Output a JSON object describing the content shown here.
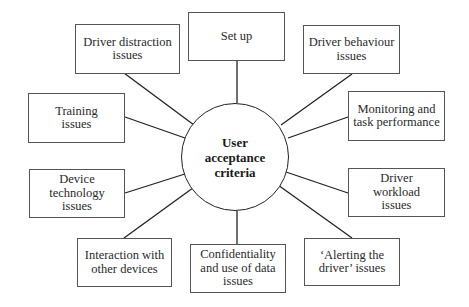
{
  "diagram": {
    "type": "hub-and-spoke",
    "center": {
      "label": "User acceptance criteria",
      "lines": [
        "User",
        "acceptance",
        "criteria"
      ]
    },
    "nodes": [
      {
        "id": "set-up",
        "label": "Set up"
      },
      {
        "id": "driver-behaviour",
        "label": "Driver behaviour issues"
      },
      {
        "id": "monitoring",
        "label": "Monitoring and task performance"
      },
      {
        "id": "driver-workload",
        "label": "Driver workload issues"
      },
      {
        "id": "alerting",
        "label": "‘Alerting the driver’ issues"
      },
      {
        "id": "confidentiality",
        "label": "Confidentiality and use of data issues"
      },
      {
        "id": "interaction",
        "label": "Interaction with other devices"
      },
      {
        "id": "device-technology",
        "label": "Device technology issues"
      },
      {
        "id": "training",
        "label": "Training issues"
      },
      {
        "id": "driver-distraction",
        "label": "Driver distraction issues"
      }
    ],
    "colors": {
      "line": "#222222",
      "box_border": "#555555",
      "text": "#2a2a2a",
      "background": "#ffffff"
    }
  }
}
